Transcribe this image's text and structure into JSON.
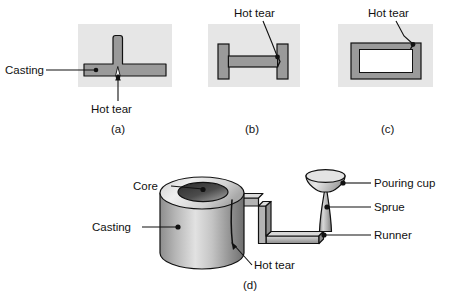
{
  "figure": {
    "title_visible": false,
    "panels": [
      {
        "id": "a",
        "caption": "(a)",
        "shape": "tee-section",
        "labels": [
          {
            "name": "casting",
            "text": "Casting"
          },
          {
            "name": "hot-tear",
            "text": "Hot tear"
          }
        ]
      },
      {
        "id": "b",
        "caption": "(b)",
        "shape": "h-section",
        "labels": [
          {
            "name": "hot-tear",
            "text": "Hot tear"
          }
        ]
      },
      {
        "id": "c",
        "caption": "(c)",
        "shape": "rectangular-frame",
        "labels": [
          {
            "name": "hot-tear",
            "text": "Hot tear"
          }
        ]
      },
      {
        "id": "d",
        "caption": "(d)",
        "shape": "cored-cylinder-with-gating-system",
        "labels": [
          {
            "name": "core",
            "text": "Core"
          },
          {
            "name": "casting",
            "text": "Casting"
          },
          {
            "name": "hot-tear",
            "text": "Hot tear"
          },
          {
            "name": "pouring-cup",
            "text": "Pouring cup"
          },
          {
            "name": "sprue",
            "text": "Sprue"
          },
          {
            "name": "runner",
            "text": "Runner"
          }
        ]
      }
    ],
    "colors": {
      "panel_background": "#e6e6e6",
      "casting_fill": "#9a9a9a",
      "casting_fill_light": "#c9c9c9",
      "core_dark": "#3a3a3a",
      "outline": "#111111",
      "page_background": "#ffffff"
    }
  }
}
